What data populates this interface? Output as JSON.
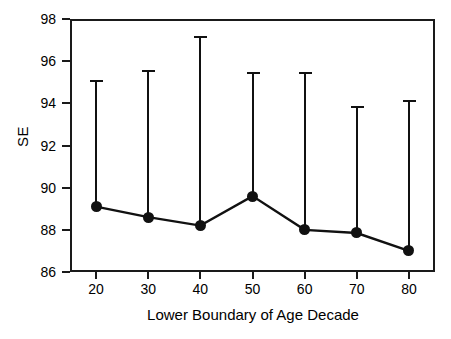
{
  "chart_data": {
    "type": "line",
    "title": "",
    "subtitle": "",
    "xlabel": "Lower Boundary of Age Decade",
    "ylabel": "SE",
    "xlim": [
      15,
      85
    ],
    "ylim": [
      86,
      98
    ],
    "grid": false,
    "legend": null,
    "x": [
      20,
      30,
      40,
      50,
      60,
      70,
      80
    ],
    "categories": [
      "20",
      "30",
      "40",
      "50",
      "60",
      "70",
      "80"
    ],
    "x_tick_labels": [
      "20",
      "30",
      "40",
      "50",
      "60",
      "70",
      "80"
    ],
    "y_tick_labels": [
      "86",
      "88",
      "90",
      "92",
      "94",
      "96",
      "98"
    ],
    "y_ticks": [
      86,
      88,
      90,
      92,
      94,
      96,
      98
    ],
    "series": [
      {
        "name": "SE",
        "values": [
          89.1,
          88.6,
          88.2,
          89.6,
          88.0,
          87.85,
          87.0
        ],
        "error_upper": [
          95.1,
          95.6,
          97.2,
          95.5,
          95.5,
          93.85,
          94.15
        ],
        "marker": "filled-circle",
        "color": "#111111"
      }
    ],
    "annotations": []
  },
  "axes": {
    "y_title": "SE",
    "x_title": "Lower Boundary of Age Decade"
  },
  "colors": {
    "axis": "#1a1a1a",
    "data": "#111111",
    "background": "#ffffff"
  }
}
